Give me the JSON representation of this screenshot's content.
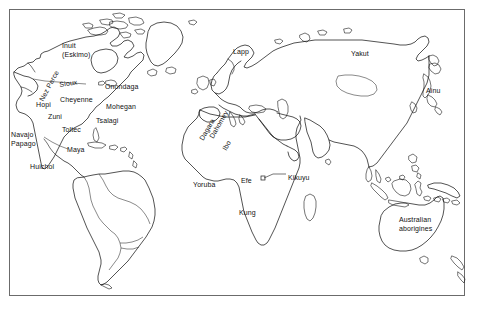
{
  "figure": {
    "frame": {
      "border_color": "#6b6b6b",
      "background": "#ffffff"
    },
    "line_color": "#1a1a1a"
  },
  "labels": {
    "north_america": [
      {
        "id": "inuit",
        "text": "Inuit\n(Eskimo)",
        "x": 62,
        "y": 42,
        "rotate": 0,
        "lines": 2
      },
      {
        "id": "nez-perce",
        "text": "Nez Perce",
        "x": 38,
        "y": 99,
        "rotate": -62,
        "lines": 1
      },
      {
        "id": "sioux",
        "text": "Sioux",
        "x": 59,
        "y": 81,
        "rotate": -8,
        "lines": 1
      },
      {
        "id": "cheyenne",
        "text": "Cheyenne",
        "x": 60,
        "y": 96,
        "rotate": 0,
        "lines": 1
      },
      {
        "id": "onondaga",
        "text": "Onondaga",
        "x": 105,
        "y": 83,
        "rotate": 0,
        "lines": 1
      },
      {
        "id": "mohegan",
        "text": "Mohegan",
        "x": 106,
        "y": 103,
        "rotate": 0,
        "lines": 1
      },
      {
        "id": "tsalagi",
        "text": "Tsalagi",
        "x": 96,
        "y": 117,
        "rotate": 0,
        "lines": 1
      },
      {
        "id": "hopi",
        "text": "Hopi",
        "x": 36,
        "y": 101,
        "rotate": 0,
        "lines": 1
      },
      {
        "id": "zuni",
        "text": "Zuni",
        "x": 48,
        "y": 113,
        "rotate": 0,
        "lines": 1
      },
      {
        "id": "toltec",
        "text": "Toltec",
        "x": 62,
        "y": 126,
        "rotate": 0,
        "lines": 1
      },
      {
        "id": "navajo-papago",
        "text": "Navajo\nPapago",
        "x": 11,
        "y": 131,
        "rotate": 0,
        "lines": 2
      },
      {
        "id": "maya",
        "text": "Maya",
        "x": 67,
        "y": 146,
        "rotate": 0,
        "lines": 1
      },
      {
        "id": "huichol",
        "text": "Huichol",
        "x": 30,
        "y": 163,
        "rotate": 0,
        "lines": 1
      }
    ],
    "africa": [
      {
        "id": "dagara",
        "text": "Dagara",
        "x": 198,
        "y": 138,
        "rotate": -60,
        "lines": 1
      },
      {
        "id": "dahomey",
        "text": "Dahomey",
        "x": 208,
        "y": 136,
        "rotate": -60,
        "lines": 1
      },
      {
        "id": "ibo",
        "text": "Ibo",
        "x": 221,
        "y": 148,
        "rotate": -60,
        "lines": 1
      },
      {
        "id": "yoruba",
        "text": "Yoruba",
        "x": 193,
        "y": 181,
        "rotate": 0,
        "lines": 1
      },
      {
        "id": "efe",
        "text": "Efe",
        "x": 241,
        "y": 177,
        "rotate": 0,
        "lines": 1
      },
      {
        "id": "kikuyu",
        "text": "Kikuyu",
        "x": 288,
        "y": 174,
        "rotate": 0,
        "lines": 1
      },
      {
        "id": "kung",
        "text": "Kung",
        "x": 239,
        "y": 209,
        "rotate": 0,
        "lines": 1
      }
    ],
    "eurasia": [
      {
        "id": "lapp",
        "text": "Lapp",
        "x": 233,
        "y": 48,
        "rotate": 0,
        "lines": 1
      },
      {
        "id": "yakut",
        "text": "Yakut",
        "x": 351,
        "y": 50,
        "rotate": 0,
        "lines": 1
      },
      {
        "id": "ainu",
        "text": "Ainu",
        "x": 426,
        "y": 87,
        "rotate": 0,
        "lines": 1
      }
    ],
    "oceania": [
      {
        "id": "australian-aborigines",
        "text": "Australian\naborigines",
        "x": 399,
        "y": 216,
        "rotate": 0,
        "lines": 2
      }
    ]
  }
}
